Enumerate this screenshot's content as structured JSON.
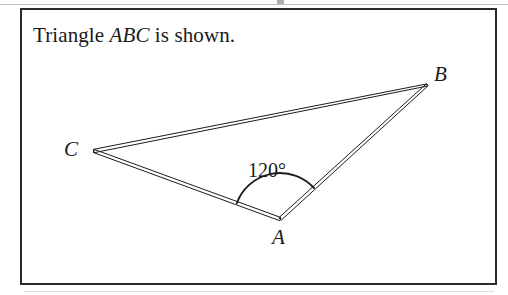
{
  "figure": {
    "caption_prefix": "Triangle ",
    "caption_labels": "ABC",
    "caption_suffix": " is shown.",
    "frame": {
      "border_color": "#2b2b2b",
      "background_color": "#ffffff"
    },
    "stroke_color": "#1c1c1c",
    "page_background": "#ffffff"
  },
  "triangle": {
    "name": "ABC",
    "vertices": [
      {
        "label": "A",
        "x": 280,
        "y": 219,
        "label_x": 272,
        "label_y": 227
      },
      {
        "label": "B",
        "x": 427,
        "y": 85,
        "label_x": 434,
        "label_y": 64
      },
      {
        "label": "C",
        "x": 94,
        "y": 151,
        "label_x": 64,
        "label_y": 139
      }
    ],
    "sides": [
      {
        "from": "C",
        "to": "B"
      },
      {
        "from": "B",
        "to": "A"
      },
      {
        "from": "A",
        "to": "C"
      }
    ],
    "angles": [
      {
        "at_vertex": "A",
        "value": "120",
        "unit": "°",
        "text": "120°",
        "label_x": 248,
        "label_y": 160,
        "arc_radius": 46
      }
    ]
  }
}
